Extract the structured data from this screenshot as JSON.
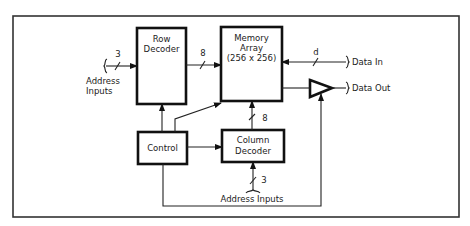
{
  "diagram": {
    "title": "",
    "blocks": {
      "row_decoder": {
        "line1": "Row",
        "line2": "Decoder"
      },
      "memory_array": {
        "line1": "Memory",
        "line2": "Array",
        "line3": "(256 x 256)"
      },
      "control": {
        "line1": "Control"
      },
      "column_decoder": {
        "line1": "Column",
        "line2": "Decoder"
      },
      "output_buffer": {
        "label": ""
      }
    },
    "signals": {
      "row_address_inputs": {
        "line1": "Address",
        "line2": "Inputs",
        "width": "3"
      },
      "row_to_array_width": "8",
      "column_to_array_width": "8",
      "column_address_inputs": {
        "label": "Address Inputs",
        "width": "3"
      },
      "data_in": {
        "label": "Data In",
        "width": "d"
      },
      "data_out": {
        "label": "Data Out"
      }
    },
    "connections": [
      {
        "from": "Address Inputs",
        "to": "Row Decoder",
        "bus_width": "3"
      },
      {
        "from": "Row Decoder",
        "to": "Memory Array",
        "bus_width": "8"
      },
      {
        "from": "Data In",
        "to": "Memory Array",
        "bus_width": "d"
      },
      {
        "from": "Memory Array",
        "to": "Output Buffer"
      },
      {
        "from": "Output Buffer",
        "to": "Data Out"
      },
      {
        "from": "Control",
        "to": "Row Decoder"
      },
      {
        "from": "Control",
        "to": "Memory Array"
      },
      {
        "from": "Control",
        "to": "Column Decoder"
      },
      {
        "from": "Control",
        "to": "Output Buffer"
      },
      {
        "from": "Column Decoder",
        "to": "Memory Array",
        "bus_width": "8"
      },
      {
        "from": "Address Inputs",
        "to": "Column Decoder",
        "bus_width": "3"
      }
    ]
  }
}
